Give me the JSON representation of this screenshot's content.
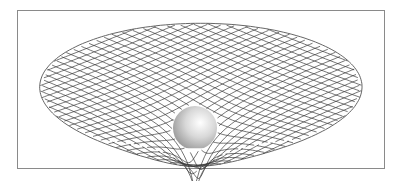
{
  "diagram": {
    "frame": {
      "stroke": "#8a8a8a"
    },
    "mesh": {
      "center_x": 201,
      "center_y": 86,
      "radius_x": 173,
      "radius_y": 64,
      "line_count": 30,
      "stroke": "#3a3a3a",
      "stroke_width": 0.7,
      "rim_stroke": "#555555",
      "well_depth": 9,
      "well_softening": 0.12,
      "well_center_u": -0.03,
      "well_center_v": 0.62
    },
    "sphere": {
      "cx": 195,
      "cy": 128,
      "r": 22,
      "highlight": "#ffffff",
      "midtone": "#d8d8d8",
      "shadow": "#8c8c8c"
    }
  }
}
